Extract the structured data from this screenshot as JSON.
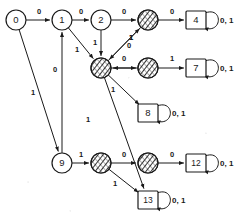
{
  "diagram": {
    "symbols": {
      "zero": "0",
      "one": "1",
      "both": "0, 1"
    },
    "colors": {
      "stroke": "#1a1a1a",
      "fill": "#ffffff",
      "hatch": "#2a2a2a",
      "background": "#ffffff"
    },
    "node_shapes": {
      "circle": "circle",
      "square": "square",
      "hatched": "hatched-circle"
    },
    "nodes": [
      {
        "id": "n0",
        "label": "0",
        "shape": "circle",
        "x": 16,
        "y": 20,
        "r": 10,
        "self_loop": false,
        "self_loop_label": ""
      },
      {
        "id": "n1",
        "label": "1",
        "shape": "circle",
        "x": 62,
        "y": 20,
        "r": 10,
        "self_loop": false,
        "self_loop_label": ""
      },
      {
        "id": "n2",
        "label": "2",
        "shape": "circle",
        "x": 101,
        "y": 20,
        "r": 10,
        "self_loop": false,
        "self_loop_label": ""
      },
      {
        "id": "h3",
        "label": "",
        "shape": "hatched",
        "x": 148,
        "y": 20,
        "r": 10,
        "self_loop": false,
        "self_loop_label": ""
      },
      {
        "id": "n4",
        "label": "4",
        "shape": "square",
        "x": 196,
        "y": 20,
        "r": 10,
        "self_loop": true,
        "self_loop_label": "0, 1"
      },
      {
        "id": "h5",
        "label": "",
        "shape": "hatched",
        "x": 101,
        "y": 68,
        "r": 10,
        "self_loop": false,
        "self_loop_label": ""
      },
      {
        "id": "h6",
        "label": "",
        "shape": "hatched",
        "x": 148,
        "y": 68,
        "r": 10,
        "self_loop": false,
        "self_loop_label": ""
      },
      {
        "id": "n7",
        "label": "7",
        "shape": "square",
        "x": 196,
        "y": 68,
        "r": 10,
        "self_loop": true,
        "self_loop_label": "0, 1"
      },
      {
        "id": "n8",
        "label": "8",
        "shape": "square",
        "x": 148,
        "y": 113,
        "r": 10,
        "self_loop": true,
        "self_loop_label": "0, 1"
      },
      {
        "id": "n9",
        "label": "9",
        "shape": "circle",
        "x": 62,
        "y": 163,
        "r": 10,
        "self_loop": false,
        "self_loop_label": ""
      },
      {
        "id": "h10",
        "label": "",
        "shape": "hatched",
        "x": 101,
        "y": 163,
        "r": 10,
        "self_loop": false,
        "self_loop_label": ""
      },
      {
        "id": "h11",
        "label": "",
        "shape": "hatched",
        "x": 148,
        "y": 163,
        "r": 10,
        "self_loop": false,
        "self_loop_label": ""
      },
      {
        "id": "n12",
        "label": "12",
        "shape": "square",
        "x": 196,
        "y": 163,
        "r": 10,
        "self_loop": true,
        "self_loop_label": "0, 1"
      },
      {
        "id": "n13",
        "label": "13",
        "shape": "square",
        "x": 148,
        "y": 200,
        "r": 10,
        "self_loop": true,
        "self_loop_label": "0, 1"
      }
    ],
    "edges": [
      {
        "from": "n0",
        "to": "n1",
        "label": "0",
        "lx": 39,
        "ly": 14
      },
      {
        "from": "n0",
        "to": "n9",
        "label": "1",
        "lx": 33,
        "ly": 95
      },
      {
        "from": "n1",
        "to": "n2",
        "label": "0",
        "lx": 81,
        "ly": 14
      },
      {
        "from": "n1",
        "to": "h5",
        "label": "1",
        "lx": 77,
        "ly": 52
      },
      {
        "from": "n2",
        "to": "h3",
        "label": "0",
        "lx": 124,
        "ly": 14
      },
      {
        "from": "n2",
        "to": "h5",
        "label": "1",
        "lx": 95,
        "ly": 45
      },
      {
        "from": "h3",
        "to": "n4",
        "label": "0",
        "lx": 172,
        "ly": 14
      },
      {
        "from": "h3",
        "to": "h5",
        "label": "1",
        "lx": 131,
        "ly": 40
      },
      {
        "from": "h5",
        "to": "h3",
        "label": "1",
        "lx": 131,
        "ly": 40
      },
      {
        "from": "h5",
        "to": "h6",
        "label": "0",
        "lx": 124,
        "ly": 61
      },
      {
        "from": "h5",
        "to": "n8",
        "label": "1",
        "lx": 113,
        "ly": 92
      },
      {
        "from": "h5",
        "to": "n13",
        "label": "1",
        "lx": 88,
        "ly": 122
      },
      {
        "from": "h6",
        "to": "n7",
        "label": "1",
        "lx": 172,
        "ly": 61
      },
      {
        "from": "h6",
        "to": "h5",
        "label": "0",
        "lx": 129,
        "ly": 48
      },
      {
        "from": "n9",
        "to": "n1",
        "label": "0",
        "lx": 55,
        "ly": 72
      },
      {
        "from": "n9",
        "to": "h10",
        "label": "1",
        "lx": 81,
        "ly": 157
      },
      {
        "from": "h10",
        "to": "h11",
        "label": "0",
        "lx": 124,
        "ly": 157
      },
      {
        "from": "h10",
        "to": "n13",
        "label": "1",
        "lx": 115,
        "ly": 186
      },
      {
        "from": "h11",
        "to": "n12",
        "label": "0",
        "lx": 172,
        "ly": 157
      }
    ]
  }
}
